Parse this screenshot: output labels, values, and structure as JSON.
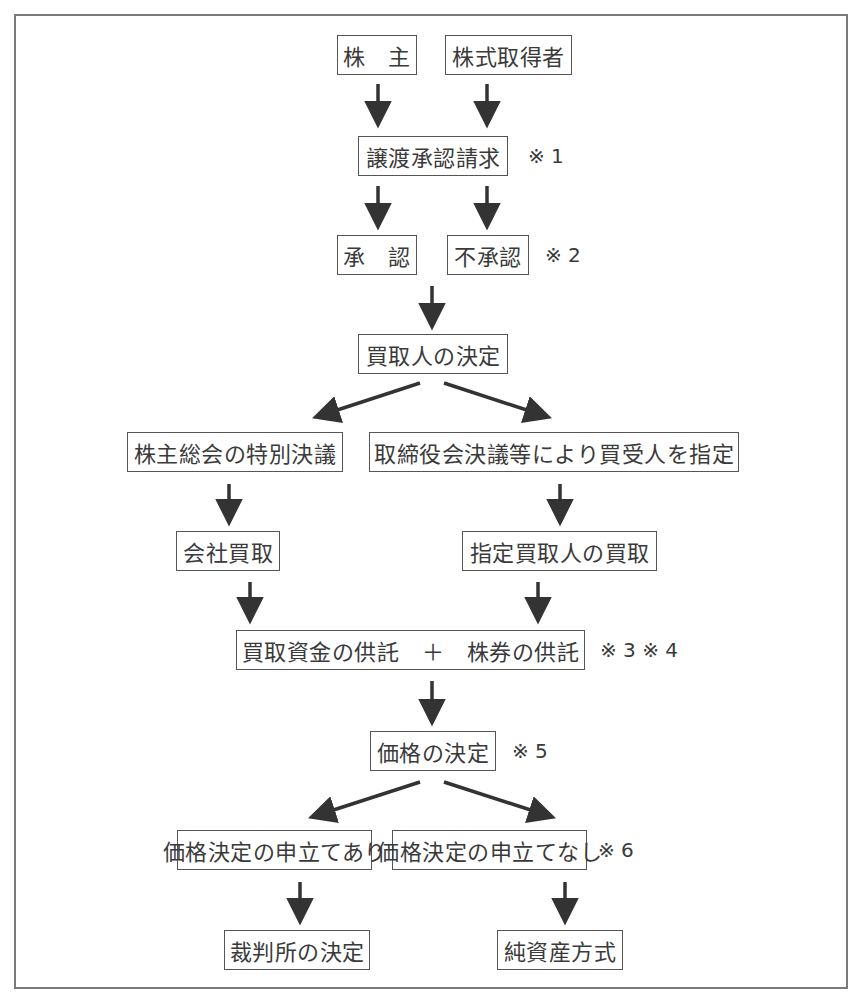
{
  "diagram": {
    "type": "flowchart",
    "nodes": {
      "shareholder": "株　主",
      "share_acquirer": "株式取得者",
      "transfer_request": "譲渡承認請求",
      "approval": "承　認",
      "disapproval": "不承認",
      "buyer_decision": "買取人の決定",
      "special_resolution": "株主総会の特別決議",
      "board_designation": "取締役会決議等により買受人を指定",
      "company_purchase": "会社買取",
      "designated_purchase": "指定買取人の買取",
      "deposit": "買取資金の供託　＋　株券の供託",
      "price_decision": "価格の決定",
      "petition_yes": "価格決定の申立てあり",
      "petition_no": "価格決定の申立てなし",
      "court_decision": "裁判所の決定",
      "net_asset_method": "純資産方式"
    },
    "notes": {
      "n1": "※ 1",
      "n2": "※ 2",
      "n34": "※ 3 ※ 4",
      "n5": "※ 5",
      "n6": "※ 6"
    },
    "edges": [
      [
        "shareholder",
        "transfer_request"
      ],
      [
        "share_acquirer",
        "transfer_request"
      ],
      [
        "transfer_request",
        "approval"
      ],
      [
        "transfer_request",
        "disapproval"
      ],
      [
        "disapproval",
        "buyer_decision"
      ],
      [
        "buyer_decision",
        "special_resolution"
      ],
      [
        "buyer_decision",
        "board_designation"
      ],
      [
        "special_resolution",
        "company_purchase"
      ],
      [
        "board_designation",
        "designated_purchase"
      ],
      [
        "company_purchase",
        "deposit"
      ],
      [
        "designated_purchase",
        "deposit"
      ],
      [
        "deposit",
        "price_decision"
      ],
      [
        "price_decision",
        "petition_yes"
      ],
      [
        "price_decision",
        "petition_no"
      ],
      [
        "petition_yes",
        "court_decision"
      ],
      [
        "petition_no",
        "net_asset_method"
      ]
    ],
    "colors": {
      "line": "#333333",
      "box_border": "#555555",
      "frame": "#7a7a7a",
      "text": "#3a3a3a"
    }
  }
}
